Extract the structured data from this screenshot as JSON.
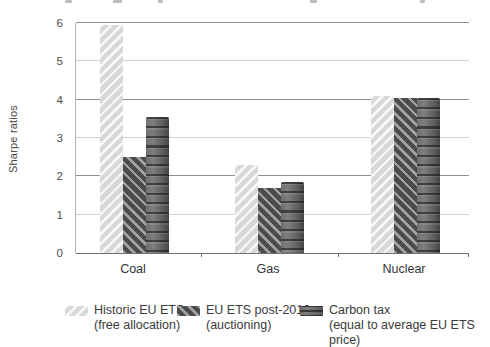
{
  "chart_data": {
    "type": "bar",
    "categories": [
      "Coal",
      "Gas",
      "Nuclear"
    ],
    "series": [
      {
        "name": "Historic EU ETS (free allocation)",
        "legend_line1": "Historic EU ETS",
        "legend_line2": "(free allocation)",
        "pattern": "light-diagonal",
        "values": [
          5.95,
          2.3,
          4.1
        ]
      },
      {
        "name": "EU ETS post-2012 (auctioning)",
        "legend_line1": "EU ETS post-2012",
        "legend_line2": "(auctioning)",
        "pattern": "dark-diagonal",
        "values": [
          2.5,
          1.7,
          4.05
        ]
      },
      {
        "name": "Carbon tax (equal to average EU ETS price)",
        "legend_line1": "Carbon tax",
        "legend_line2": "(equal to average EU ETS price)",
        "pattern": "dark-horizontal",
        "values": [
          3.55,
          1.85,
          4.05
        ]
      }
    ],
    "xlabel": "",
    "ylabel": "Sharpe ratios",
    "ylim": [
      0,
      6
    ],
    "yticks": [
      0,
      1,
      2,
      3,
      4,
      5,
      6
    ],
    "grid": "horizontal, major lines at even values",
    "legend_position": "bottom"
  },
  "colors": {
    "background": "#ffffff",
    "light_series_base": "#d8d8d8",
    "light_series_stripe": "#f7f7f7",
    "dark_series_base": "#4b4b4b",
    "dark_series_stripe": "#a0a0a0",
    "carbon_tax_base": "#606060",
    "grid_major": "#8f8f8f",
    "grid_minor": "#d2d2d2",
    "axis_line": "#707070",
    "text": "#3a3a3a"
  }
}
